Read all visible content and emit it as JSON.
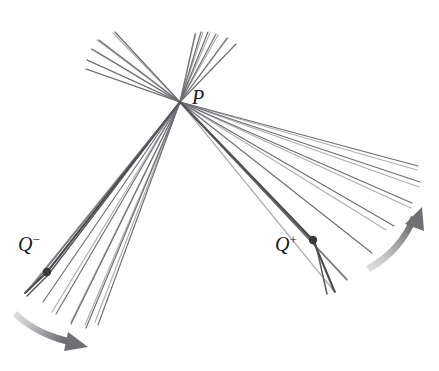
{
  "figure": {
    "width": 439,
    "height": 371,
    "background_color": "#ffffff",
    "ray_color": "#6e6e73",
    "bold_ray_color": "#4a4a4f",
    "dot_color": "#3a3a3d",
    "arrow_color_dark": "#7a7a7e",
    "arrow_color_light": "#d8d8da",
    "label_color": "#1b1b1b"
  },
  "labels": {
    "P": {
      "base": "P",
      "sup": ""
    },
    "Q_minus": {
      "base": "Q",
      "sup": "−"
    },
    "Q_plus": {
      "base": "Q",
      "sup": "+"
    }
  },
  "points": [
    {
      "name": "P",
      "x": 180,
      "y": 102,
      "marked": false
    },
    {
      "name": "Q_minus",
      "x": 47,
      "y": 272,
      "marked": true
    },
    {
      "name": "Q_plus",
      "x": 313,
      "y": 240,
      "marked": true
    }
  ],
  "chart_data": {
    "type": "scatter",
    "xlabel": "",
    "ylabel": "",
    "xlim": [
      0,
      439
    ],
    "ylim": [
      371,
      0
    ],
    "grid": false,
    "legend": null,
    "focal_point": {
      "label": "P",
      "x": 180,
      "y": 102
    },
    "annotations": [
      {
        "text": "P",
        "x": 196,
        "y": 98
      },
      {
        "text": "Q−",
        "x": 30,
        "y": 246
      },
      {
        "text": "Q+",
        "x": 290,
        "y": 246
      }
    ],
    "series": [
      {
        "name": "upper-left-fan",
        "kind": "rays-from-P",
        "stroke": "#6e6e73",
        "width": 1.2,
        "segments": [
          [
            [
              180,
              102
            ],
            [
              86,
              69
            ]
          ],
          [
            [
              180,
              102
            ],
            [
              87,
              60
            ]
          ],
          [
            [
              180,
              102
            ],
            [
              91,
              49
            ]
          ],
          [
            [
              180,
              102
            ],
            [
              97,
              40
            ]
          ],
          [
            [
              180,
              102
            ],
            [
              113,
              33
            ]
          ]
        ]
      },
      {
        "name": "upper-right-fan",
        "kind": "rays-from-P",
        "stroke": "#6e6e73",
        "width": 1.2,
        "segments": [
          [
            [
              180,
              102
            ],
            [
              196,
              33
            ]
          ],
          [
            [
              180,
              102
            ],
            [
              203,
              32
            ]
          ],
          [
            [
              180,
              102
            ],
            [
              210,
              33
            ]
          ],
          [
            [
              180,
              102
            ],
            [
              218,
              35
            ]
          ],
          [
            [
              180,
              102
            ],
            [
              228,
              38
            ]
          ]
        ]
      },
      {
        "name": "lower-left-fan",
        "kind": "rays-from-P-through-Qminus",
        "stroke": "#6e6e73",
        "width": 1.2,
        "segments": [
          [
            [
              180,
              102
            ],
            [
              26,
              292
            ]
          ],
          [
            [
              180,
              102
            ],
            [
              30,
              288
            ]
          ],
          [
            [
              180,
              102
            ],
            [
              52,
              312
            ]
          ],
          [
            [
              180,
              102
            ],
            [
              71,
              322
            ]
          ],
          [
            [
              180,
              102
            ],
            [
              85,
              325
            ]
          ],
          [
            [
              180,
              102
            ],
            [
              95,
              322
            ]
          ]
        ]
      },
      {
        "name": "lower-right-fan",
        "kind": "rays-from-P-through-Qplus",
        "stroke": "#6e6e73",
        "width": 1.2,
        "segments": [
          [
            [
              180,
              102
            ],
            [
              334,
              291
            ]
          ],
          [
            [
              180,
              102
            ],
            [
              347,
              279
            ]
          ],
          [
            [
              180,
              102
            ],
            [
              386,
              230
            ]
          ],
          [
            [
              180,
              102
            ],
            [
              411,
              208
            ]
          ],
          [
            [
              180,
              102
            ],
            [
              419,
              187
            ]
          ],
          [
            [
              180,
              102
            ],
            [
              417,
              170
            ]
          ]
        ]
      },
      {
        "name": "bold-ray-through-Qminus",
        "kind": "bold",
        "stroke": "#4a4a4f",
        "width": 2.0,
        "segments": [
          [
            [
              180,
              102
            ],
            [
              47,
              272
            ],
            [
              26,
              292
            ]
          ]
        ]
      },
      {
        "name": "bold-ray-through-Qplus",
        "kind": "bold",
        "stroke": "#4a4a4f",
        "width": 2.0,
        "segments": [
          [
            [
              180,
              102
            ],
            [
              313,
              240
            ],
            [
              334,
              291
            ]
          ]
        ]
      }
    ],
    "motion_arrows": [
      {
        "name": "left-motion-arrow",
        "path": "M 14,318 C 32,333 55,343 78,345",
        "direction": "clockwise-right-down",
        "tip": [
          82,
          345
        ]
      },
      {
        "name": "right-motion-arrow",
        "path": "M 374,270 C 396,258 412,238 420,215",
        "direction": "counterclockwise-up-right",
        "tip": [
          421,
          211
        ]
      }
    ]
  }
}
